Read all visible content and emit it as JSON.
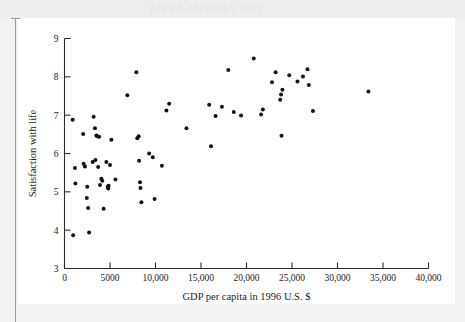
{
  "figure": {
    "type_label": "scatter-plot",
    "background_color": "#f2f2f2",
    "page_color": "#ffffff",
    "marker_color": "#111111",
    "axis_color": "#2b2b2b"
  },
  "ghost": {
    "text": "bleed-through text"
  },
  "chart_data": {
    "type": "scatter",
    "title": "",
    "subtitle": "",
    "xlabel": "GDP per capita in 1996 U.S. $",
    "ylabel": "Satisfaction with life",
    "xlim": [
      0,
      40000
    ],
    "ylim": [
      3,
      9
    ],
    "grid": false,
    "legend": null,
    "legend_position": "none",
    "xticks": [
      0,
      5000,
      10000,
      15000,
      20000,
      25000,
      30000,
      35000,
      40000
    ],
    "xtick_labels": [
      "0",
      "5000",
      "10,000",
      "15,000",
      "20,000",
      "25,000",
      "30,000",
      "35,000",
      "40,000"
    ],
    "yticks": [
      3,
      4,
      5,
      6,
      7,
      8,
      9
    ],
    "ytick_labels": [
      "3",
      "4",
      "5",
      "6",
      "7",
      "8",
      "9"
    ],
    "marker": "dot",
    "marker_size": 2.0,
    "n_points": 74,
    "points": [
      [
        900,
        6.88
      ],
      [
        950,
        3.87
      ],
      [
        1150,
        5.62
      ],
      [
        1200,
        5.22
      ],
      [
        2050,
        6.51
      ],
      [
        2100,
        5.73
      ],
      [
        2250,
        5.66
      ],
      [
        2450,
        4.84
      ],
      [
        2500,
        5.13
      ],
      [
        2600,
        4.58
      ],
      [
        2700,
        3.94
      ],
      [
        3100,
        5.78
      ],
      [
        3200,
        6.96
      ],
      [
        3350,
        6.66
      ],
      [
        3400,
        5.83
      ],
      [
        3500,
        6.47
      ],
      [
        3600,
        6.45
      ],
      [
        3700,
        5.65
      ],
      [
        3800,
        6.44
      ],
      [
        3900,
        5.18
      ],
      [
        4050,
        5.34
      ],
      [
        4150,
        5.29
      ],
      [
        4300,
        4.56
      ],
      [
        4600,
        5.78
      ],
      [
        4750,
        5.13
      ],
      [
        4800,
        5.09
      ],
      [
        4850,
        5.16
      ],
      [
        5000,
        5.7
      ],
      [
        5150,
        6.36
      ],
      [
        5600,
        5.32
      ],
      [
        6900,
        7.52
      ],
      [
        7900,
        8.12
      ],
      [
        8000,
        6.4
      ],
      [
        8150,
        6.45
      ],
      [
        8200,
        5.81
      ],
      [
        8300,
        5.25
      ],
      [
        8350,
        5.1
      ],
      [
        8450,
        4.73
      ],
      [
        9300,
        6.0
      ],
      [
        9700,
        5.9
      ],
      [
        9900,
        4.81
      ],
      [
        10700,
        5.68
      ],
      [
        11200,
        7.12
      ],
      [
        11500,
        7.3
      ],
      [
        13400,
        6.66
      ],
      [
        15900,
        7.27
      ],
      [
        16100,
        6.19
      ],
      [
        16600,
        6.98
      ],
      [
        17300,
        7.22
      ],
      [
        18000,
        8.18
      ],
      [
        18600,
        7.08
      ],
      [
        19400,
        6.99
      ],
      [
        20800,
        8.48
      ],
      [
        21600,
        7.02
      ],
      [
        21800,
        7.15
      ],
      [
        22800,
        7.86
      ],
      [
        23200,
        8.12
      ],
      [
        23700,
        7.4
      ],
      [
        23800,
        7.54
      ],
      [
        23850,
        6.46
      ],
      [
        23950,
        7.66
      ],
      [
        24700,
        8.04
      ],
      [
        25600,
        7.88
      ],
      [
        26200,
        8.01
      ],
      [
        26700,
        8.2
      ],
      [
        26850,
        7.79
      ],
      [
        27300,
        7.11
      ],
      [
        33400,
        7.62
      ]
    ]
  }
}
